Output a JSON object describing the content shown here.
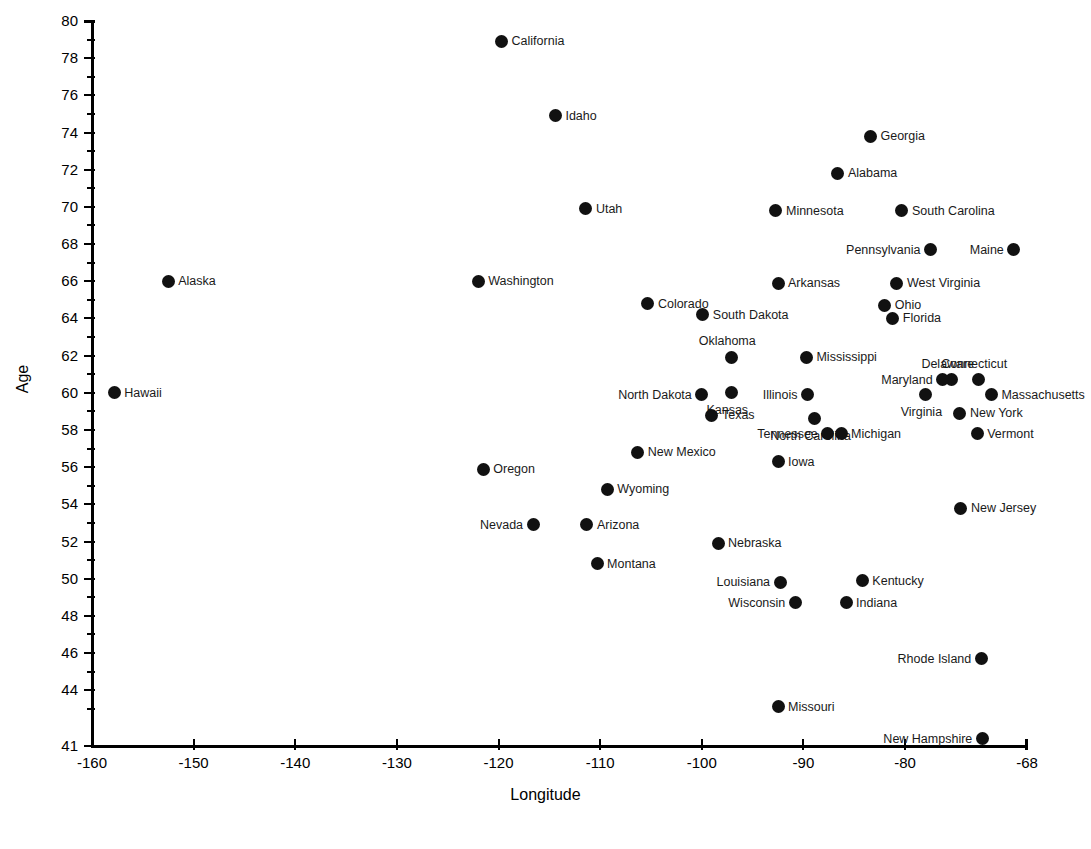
{
  "chart_data": {
    "type": "scatter",
    "title": "",
    "xlabel": "Longitude",
    "ylabel": "Age",
    "xlim": [
      -160,
      -68
    ],
    "ylim": [
      41,
      80
    ],
    "grid": false,
    "legend": null,
    "xticks": [
      -160,
      -150,
      -140,
      -130,
      -120,
      -110,
      -100,
      -90,
      -80,
      -68
    ],
    "xtick_labels": [
      "-160",
      "-150",
      "-140",
      "-130",
      "-120",
      "-110",
      "-100",
      "-90",
      "-80",
      "-68"
    ],
    "yticks": [
      41,
      42,
      44,
      46,
      48,
      50,
      52,
      54,
      56,
      58,
      60,
      62,
      64,
      66,
      68,
      70,
      72,
      74,
      76,
      78,
      80
    ],
    "ytick_labels": [
      "41",
      "",
      "44",
      "46",
      "48",
      "50",
      "52",
      "54",
      "56",
      "58",
      "60",
      "62",
      "64",
      "66",
      "68",
      "70",
      "72",
      "74",
      "76",
      "78",
      "80"
    ],
    "ytick_major": [
      41,
      44,
      46,
      48,
      50,
      52,
      54,
      56,
      58,
      60,
      62,
      64,
      66,
      68,
      70,
      72,
      74,
      76,
      78,
      80
    ],
    "ytick_minor": [
      43,
      45,
      47,
      49,
      51,
      53,
      55,
      57,
      59,
      61,
      63,
      65,
      67,
      69,
      71,
      73,
      75,
      77,
      79
    ],
    "point_color": "#111111",
    "marker_size": 13,
    "points": [
      {
        "label": "California",
        "x": -119.7,
        "y": 78.9,
        "label_side": "right"
      },
      {
        "label": "Idaho",
        "x": -114.4,
        "y": 74.9,
        "label_side": "right"
      },
      {
        "label": "Georgia",
        "x": -83.4,
        "y": 73.8,
        "label_side": "right"
      },
      {
        "label": "Alabama",
        "x": -86.6,
        "y": 71.8,
        "label_side": "right"
      },
      {
        "label": "Minnesota",
        "x": -92.7,
        "y": 69.8,
        "label_side": "right"
      },
      {
        "label": "South Carolina",
        "x": -80.3,
        "y": 69.8,
        "label_side": "right"
      },
      {
        "label": "Utah",
        "x": -111.4,
        "y": 69.9,
        "label_side": "right"
      },
      {
        "label": "Pennsylvania",
        "x": -77.5,
        "y": 67.7,
        "label_side": "left"
      },
      {
        "label": "Maine",
        "x": -69.3,
        "y": 67.7,
        "label_side": "left"
      },
      {
        "label": "Alaska",
        "x": -152.5,
        "y": 66.0,
        "label_side": "right"
      },
      {
        "label": "Washington",
        "x": -122.0,
        "y": 66.0,
        "label_side": "right"
      },
      {
        "label": "Arkansas",
        "x": -92.5,
        "y": 65.9,
        "label_side": "right"
      },
      {
        "label": "West Virginia",
        "x": -80.8,
        "y": 65.9,
        "label_side": "right"
      },
      {
        "label": "Colorado",
        "x": -105.3,
        "y": 64.8,
        "label_side": "right"
      },
      {
        "label": "Ohio",
        "x": -82.0,
        "y": 64.7,
        "label_side": "right"
      },
      {
        "label": "South Dakota",
        "x": -99.9,
        "y": 64.2,
        "label_side": "right"
      },
      {
        "label": "Florida",
        "x": -81.2,
        "y": 64.0,
        "label_side": "right"
      },
      {
        "label": "Oklahoma",
        "x": -97.1,
        "y": 61.9,
        "label_side": "above"
      },
      {
        "label": "Mississippi",
        "x": -89.7,
        "y": 61.9,
        "label_side": "right"
      },
      {
        "label": "Delaware",
        "x": -75.4,
        "y": 60.7,
        "label_side": "above"
      },
      {
        "label": "Connecticut",
        "x": -72.8,
        "y": 60.7,
        "label_side": "above"
      },
      {
        "label": "Maryland",
        "x": -76.3,
        "y": 60.7,
        "label_side": "left"
      },
      {
        "label": "Hawaii",
        "x": -157.8,
        "y": 60.0,
        "label_side": "right"
      },
      {
        "label": "Kansas",
        "x": -97.1,
        "y": 60.0,
        "label_side": "below"
      },
      {
        "label": "North Dakota",
        "x": -100.0,
        "y": 59.9,
        "label_side": "left"
      },
      {
        "label": "Illinois",
        "x": -89.6,
        "y": 59.9,
        "label_side": "left"
      },
      {
        "label": "Virginia",
        "x": -78.0,
        "y": 59.9,
        "label_side": "below"
      },
      {
        "label": "Massachusetts",
        "x": -71.5,
        "y": 59.9,
        "label_side": "right"
      },
      {
        "label": "New York",
        "x": -74.6,
        "y": 58.9,
        "label_side": "right"
      },
      {
        "label": "Texas",
        "x": -99.0,
        "y": 58.8,
        "label_side": "right"
      },
      {
        "label": "North Carolina",
        "x": -88.9,
        "y": 58.6,
        "label_side": "below"
      },
      {
        "label": "Tennessee",
        "x": -87.6,
        "y": 57.8,
        "label_side": "left"
      },
      {
        "label": "Michigan",
        "x": -86.3,
        "y": 57.8,
        "label_side": "right"
      },
      {
        "label": "Vermont",
        "x": -72.9,
        "y": 57.8,
        "label_side": "right"
      },
      {
        "label": "New Mexico",
        "x": -106.3,
        "y": 56.8,
        "label_side": "right"
      },
      {
        "label": "Iowa",
        "x": -92.5,
        "y": 56.3,
        "label_side": "right"
      },
      {
        "label": "Oregon",
        "x": -121.5,
        "y": 55.9,
        "label_side": "right"
      },
      {
        "label": "Wyoming",
        "x": -109.3,
        "y": 54.8,
        "label_side": "right"
      },
      {
        "label": "New Jersey",
        "x": -74.5,
        "y": 53.8,
        "label_side": "right"
      },
      {
        "label": "Nevada",
        "x": -116.6,
        "y": 52.9,
        "label_side": "left"
      },
      {
        "label": "Arizona",
        "x": -111.3,
        "y": 52.9,
        "label_side": "right"
      },
      {
        "label": "Nebraska",
        "x": -98.4,
        "y": 51.9,
        "label_side": "right"
      },
      {
        "label": "Montana",
        "x": -110.3,
        "y": 50.8,
        "label_side": "right"
      },
      {
        "label": "Louisiana",
        "x": -92.3,
        "y": 49.8,
        "label_side": "left"
      },
      {
        "label": "Kentucky",
        "x": -84.2,
        "y": 49.9,
        "label_side": "right"
      },
      {
        "label": "Wisconsin",
        "x": -90.8,
        "y": 48.7,
        "label_side": "left"
      },
      {
        "label": "Indiana",
        "x": -85.8,
        "y": 48.7,
        "label_side": "right"
      },
      {
        "label": "Rhode Island",
        "x": -72.5,
        "y": 45.7,
        "label_side": "left"
      },
      {
        "label": "Missouri",
        "x": -92.5,
        "y": 43.1,
        "label_side": "right"
      },
      {
        "label": "New Hampshire",
        "x": -72.4,
        "y": 41.4,
        "label_side": "left"
      }
    ]
  },
  "caption": {
    "text": ""
  }
}
